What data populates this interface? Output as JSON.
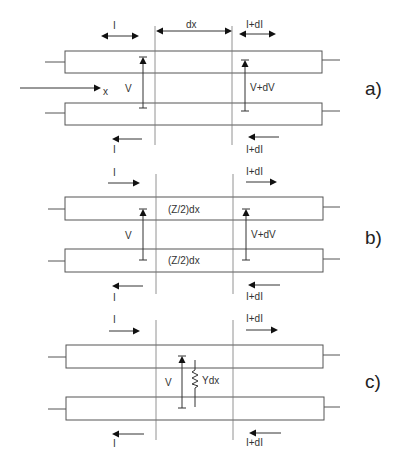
{
  "figure": {
    "width": 408,
    "height": 471,
    "panels": [
      {
        "id": "a",
        "label": "a)",
        "label_pos": [
          365,
          95
        ],
        "rect_top": {
          "x": 65,
          "y": 51,
          "w": 257,
          "h": 22
        },
        "rect_bottom": {
          "x": 65,
          "y": 103,
          "w": 257,
          "h": 22
        },
        "section_lines": {
          "x1": 155,
          "x2": 232,
          "y_top": 26,
          "y_bottom": 145
        },
        "top_labels": [
          {
            "text": "I",
            "x": 113,
            "y": 29
          },
          {
            "text": "dx",
            "x": 186,
            "y": 28
          },
          {
            "text": "I+dI",
            "x": 246,
            "y": 28
          }
        ],
        "x_axis": {
          "label": "x",
          "x1": 20,
          "x2": 100,
          "y": 88
        },
        "V_left": {
          "label": "V",
          "x": 143,
          "y_top": 58,
          "y_bottom": 108,
          "label_x": 125
        },
        "V_right": {
          "label": "V+dV",
          "x": 245,
          "y_top": 61,
          "y_bottom": 111,
          "label_x": 250
        },
        "bottom_labels": [
          {
            "text": "I",
            "x": 113,
            "y": 153
          },
          {
            "text": "I+dI",
            "x": 246,
            "y": 153
          }
        ]
      },
      {
        "id": "b",
        "label": "b)",
        "label_pos": [
          365,
          244
        ],
        "rect_top": {
          "x": 65,
          "y": 197,
          "w": 258,
          "h": 23
        },
        "rect_bottom": {
          "x": 65,
          "y": 249,
          "w": 258,
          "h": 23
        },
        "section_lines": {
          "x1": 156,
          "x2": 233,
          "y_top": 174,
          "y_bottom": 294
        },
        "top_labels": [
          {
            "text": "I",
            "x": 113,
            "y": 176
          },
          {
            "text": "I+dI",
            "x": 246,
            "y": 175
          }
        ],
        "impedance_top": "(Z/2)dx",
        "impedance_bottom": "(Z/2)dx",
        "V_left": {
          "label": "V",
          "x": 143,
          "y_top": 209,
          "y_bottom": 260,
          "label_x": 125
        },
        "V_right": {
          "label": "V+dV",
          "x": 246,
          "y_top": 209,
          "y_bottom": 260,
          "label_x": 251
        },
        "bottom_labels": [
          {
            "text": "I",
            "x": 113,
            "y": 301
          },
          {
            "text": "I+dI",
            "x": 246,
            "y": 300
          }
        ]
      },
      {
        "id": "c",
        "label": "c)",
        "label_pos": [
          365,
          388
        ],
        "rect_top": {
          "x": 66,
          "y": 345,
          "w": 257,
          "h": 23
        },
        "rect_bottom": {
          "x": 66,
          "y": 397,
          "w": 258,
          "h": 23
        },
        "section_lines": {
          "x1": 156,
          "x2": 233,
          "y_top": 320,
          "y_bottom": 440
        },
        "top_labels": [
          {
            "text": "I",
            "x": 113,
            "y": 323
          },
          {
            "text": "I+dI",
            "x": 246,
            "y": 322
          }
        ],
        "V_left": {
          "label": "V",
          "x": 182,
          "y_top": 356,
          "y_bottom": 408,
          "label_x": 165
        },
        "admittance": {
          "label": "Ydx",
          "x": 195,
          "y_top": 360,
          "y_bottom": 407
        },
        "bottom_labels": [
          {
            "text": "I",
            "x": 113,
            "y": 447
          },
          {
            "text": "I+dI",
            "x": 246,
            "y": 446
          }
        ]
      }
    ]
  }
}
